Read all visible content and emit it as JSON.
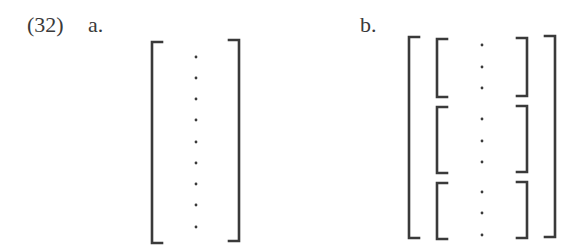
{
  "example": {
    "number": "(32)",
    "a": {
      "label": "a.",
      "structure": "single bracket containing a vertical sequence of dots",
      "dot_count": 9
    },
    "b": {
      "label": "b.",
      "structure": "outer bracket containing three inner bracketed groups, each with dots",
      "groups": [
        {
          "dot_count": 3
        },
        {
          "dot_count": 3
        },
        {
          "dot_count": 3
        }
      ]
    }
  },
  "colors": {
    "ink": "#333333",
    "background": "#ffffff"
  }
}
